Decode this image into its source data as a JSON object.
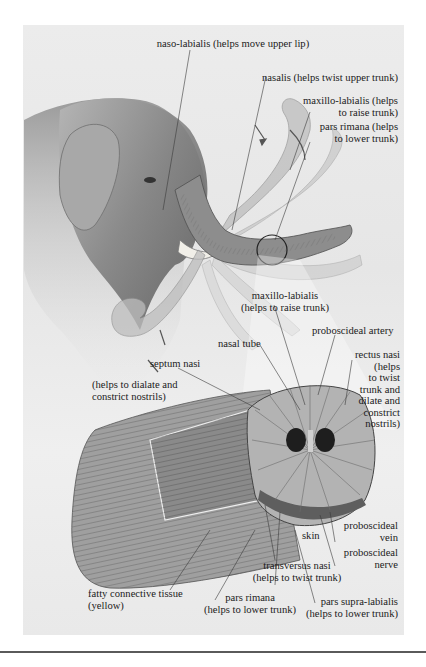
{
  "figure": {
    "accent_colors": {
      "panel_bg": "#e8e8e8",
      "ink": "#1b1b1b",
      "shade": "#8c8c8c",
      "highlight_ring": "#222222"
    }
  },
  "labels": {
    "naso_labialis": "naso-labialis (helps move upper lip)",
    "nasalis": "nasalis (helps twist upper trunk)",
    "maxillo_labialis_top": "maxillo-labialis (helps\nto raise trunk)",
    "pars_rimana_top": "pars rimana (helps\nto lower trunk)",
    "maxillo_labialis_mid": "maxillo-labialis\n(helps to raise trunk)",
    "proboscideal_artery": "proboscideal artery",
    "nasal_tube": "nasal tube",
    "rectus_nasi": "rectus nasi\n(helps\nto twist\ntrunk and\ndilate and\nconstrict\nnostrils)",
    "septum_nasi": "septum nasi",
    "septum_nasi_note": "(helps to dialate and\nconstrict nostrils)",
    "skin": "skin",
    "proboscideal_vein": "proboscideal\nvein",
    "proboscideal_nerve": "proboscideal\nnerve",
    "transversus_nasi": "transversus nasi\n(helps to twist trunk)",
    "pars_rimana_bottom": "pars rimana\n(helps to lower trunk)",
    "pars_supra_labialis": "pars supra-labialis\n(helps to lower trunk)",
    "fatty_tissue": "fatty connective tissue\n(yellow)"
  }
}
